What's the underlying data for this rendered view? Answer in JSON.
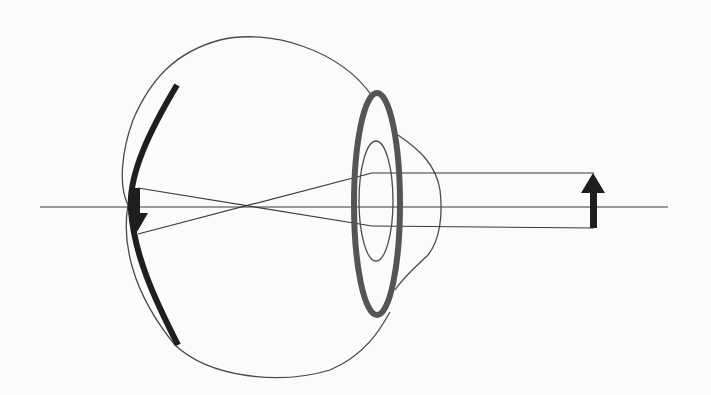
{
  "diagram": {
    "title": "Myopia / eye optics schematic",
    "colors": {
      "background": "#fbfbf9",
      "outline": "#4a4a4a",
      "lens": "#555555",
      "retina": "#1e1e1e",
      "rays": "#3a3a3a",
      "object_arrow": "#1e1e1e"
    },
    "elements": {
      "eyeball_outline": "eyeball",
      "lens_outer": "lens",
      "lens_inner": "pupil",
      "cornea": "cornea",
      "retina": "retina",
      "optical_axis": "optical axis",
      "ray_top": "upper ray",
      "ray_bottom": "lower ray",
      "object": "object (upright arrow)",
      "image": "image (inverted arrow)"
    }
  }
}
